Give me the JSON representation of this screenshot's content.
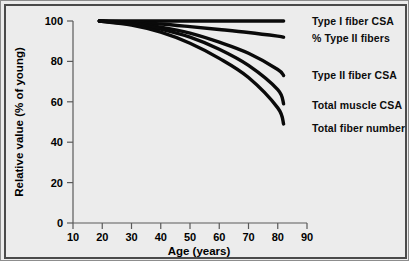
{
  "chart_data": {
    "type": "line",
    "title": "",
    "xlabel": "Age (years)",
    "ylabel": "Relative value (% of young)",
    "xlim": [
      10,
      90
    ],
    "ylim": [
      0,
      100
    ],
    "xticks": [
      10,
      20,
      30,
      40,
      50,
      60,
      70,
      80,
      90
    ],
    "yticks": [
      0,
      20,
      40,
      60,
      80,
      100
    ],
    "grid": false,
    "legend_position": "right-inline-labels",
    "x": [
      19,
      30,
      40,
      50,
      60,
      70,
      80,
      82
    ],
    "series": [
      {
        "name": "Type I fiber CSA",
        "label": "Type I  fiber CSA",
        "values": [
          100,
          100,
          100,
          100,
          100,
          100,
          100,
          100
        ]
      },
      {
        "name": "% Type II fibers",
        "label": "%  Type II  fibers",
        "values": [
          100,
          99.5,
          98.5,
          97.2,
          95.8,
          94.3,
          92.5,
          92
        ]
      },
      {
        "name": "Type II fiber CSA",
        "label": "Type II  fiber CSA",
        "values": [
          100,
          99,
          97,
          94,
          89.5,
          84,
          76,
          73
        ]
      },
      {
        "name": "Total muscle CSA",
        "label": "Total muscle CSA",
        "values": [
          100,
          98.5,
          96,
          92,
          86,
          78,
          66,
          59
        ]
      },
      {
        "name": "Total fiber number",
        "label": "Total  fiber number",
        "values": [
          100,
          98,
          94.5,
          89,
          81.5,
          72,
          57,
          49
        ]
      }
    ]
  },
  "axes": {
    "x_label": "Age (years)",
    "y_label": "Relative value (% of young)",
    "x_ticks": [
      "10",
      "20",
      "30",
      "40",
      "50",
      "60",
      "70",
      "80",
      "90"
    ],
    "y_ticks": [
      "0",
      "20",
      "40",
      "60",
      "80",
      "100"
    ]
  },
  "labels": {
    "type_i_fiber_csa": "Type I  fiber CSA",
    "pct_type_ii_fibers": "%  Type II  fibers",
    "type_ii_fiber_csa": "Type II  fiber CSA",
    "total_muscle_csa": "Total muscle CSA",
    "total_fiber_number": "Total  fiber number"
  },
  "colors": {
    "background": "#ececec",
    "frame": "#4a4a4a",
    "curve": "#0a0a0a",
    "axis": "#5a5a5a",
    "text": "#000000"
  }
}
